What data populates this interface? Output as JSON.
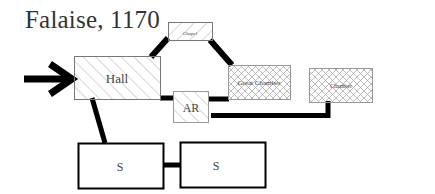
{
  "title": "Falaise, 1170",
  "rooms": {
    "hall": {
      "label": "Hall"
    },
    "chapel": {
      "label": "Chapel"
    },
    "great_chamber": {
      "label": "Great Chamber"
    },
    "chamber": {
      "label": "Chamber"
    },
    "ar": {
      "label": "AR"
    },
    "s1": {
      "label": "S"
    },
    "s2": {
      "label": "S"
    }
  },
  "colors": {
    "line": "#000000",
    "hatch": "#8a8a8a",
    "text": "#444444"
  }
}
